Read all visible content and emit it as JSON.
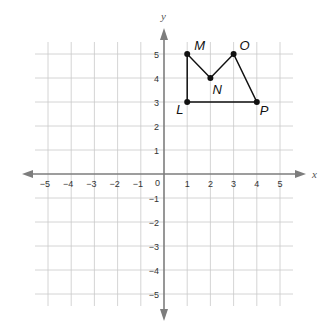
{
  "diagram": {
    "type": "coordinate-plane",
    "axes": {
      "x_label": "x",
      "y_label": "y",
      "origin_label": "0",
      "x_range": [
        -5,
        5
      ],
      "y_range": [
        -5,
        5
      ],
      "x_ticks": [
        "-5",
        "-4",
        "-3",
        "-2",
        "-1",
        "1",
        "2",
        "3",
        "4",
        "5"
      ],
      "y_ticks": [
        "5",
        "4",
        "3",
        "2",
        "1",
        "-1",
        "-2",
        "-3",
        "-4",
        "-5"
      ]
    },
    "figure": {
      "name": "LMNOP",
      "points": [
        {
          "label": "L",
          "x": 1,
          "y": 3
        },
        {
          "label": "M",
          "x": 1,
          "y": 5
        },
        {
          "label": "N",
          "x": 2,
          "y": 4
        },
        {
          "label": "O",
          "x": 3,
          "y": 5
        },
        {
          "label": "P",
          "x": 4,
          "y": 3
        }
      ],
      "order": [
        "L",
        "M",
        "N",
        "O",
        "P"
      ]
    },
    "colors": {
      "grid": "#c9c9c9",
      "axis": "#7d7d7d",
      "figure": "#111111",
      "background": "#ffffff"
    }
  }
}
